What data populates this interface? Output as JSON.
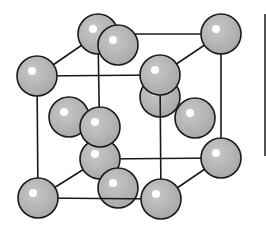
{
  "diagram": {
    "type": "crystal-lattice",
    "structure": "face-centered-cubic",
    "colors": {
      "background": "#ffffff",
      "atom_fill": "#b8b8b8",
      "atom_stroke": "#1a1a1a",
      "highlight": "#ffffff",
      "edge": "#1a1a1a"
    },
    "atom_radius": 20,
    "atoms": [
      {
        "id": "back-top-left-corner",
        "x": 98,
        "y": 34
      },
      {
        "id": "back-top-right-corner",
        "x": 221,
        "y": 34
      },
      {
        "id": "back-bottom-left-corner",
        "x": 100,
        "y": 159
      },
      {
        "id": "back-bottom-right-corner",
        "x": 221,
        "y": 158
      },
      {
        "id": "back-face-center",
        "x": 160,
        "y": 97
      },
      {
        "id": "left-face-center",
        "x": 69,
        "y": 117
      },
      {
        "id": "right-face-center",
        "x": 195,
        "y": 118
      },
      {
        "id": "top-face-center",
        "x": 118,
        "y": 45
      },
      {
        "id": "bottom-face-center",
        "x": 118,
        "y": 188
      },
      {
        "id": "front-face-center",
        "x": 100,
        "y": 127
      },
      {
        "id": "front-top-left-corner",
        "x": 37,
        "y": 76
      },
      {
        "id": "front-top-right-corner",
        "x": 160,
        "y": 75
      },
      {
        "id": "front-bottom-left-corner",
        "x": 38,
        "y": 198
      },
      {
        "id": "front-bottom-right-corner",
        "x": 161,
        "y": 199
      }
    ],
    "edges": [
      {
        "id": "back-top",
        "x1": 98,
        "y1": 34,
        "x2": 221,
        "y2": 34
      },
      {
        "id": "back-left",
        "x1": 98,
        "y1": 34,
        "x2": 100,
        "y2": 159
      },
      {
        "id": "back-right",
        "x1": 221,
        "y1": 34,
        "x2": 221,
        "y2": 158
      },
      {
        "id": "back-bottom",
        "x1": 100,
        "y1": 159,
        "x2": 221,
        "y2": 158
      },
      {
        "id": "top-left-depth",
        "x1": 37,
        "y1": 76,
        "x2": 98,
        "y2": 34
      },
      {
        "id": "top-right-depth",
        "x1": 160,
        "y1": 75,
        "x2": 221,
        "y2": 34
      },
      {
        "id": "bottom-left-depth",
        "x1": 38,
        "y1": 198,
        "x2": 100,
        "y2": 159
      },
      {
        "id": "bottom-right-depth",
        "x1": 161,
        "y1": 199,
        "x2": 221,
        "y2": 158
      },
      {
        "id": "front-top",
        "x1": 37,
        "y1": 76,
        "x2": 160,
        "y2": 75
      },
      {
        "id": "front-left",
        "x1": 37,
        "y1": 76,
        "x2": 38,
        "y2": 198
      },
      {
        "id": "front-right",
        "x1": 160,
        "y1": 75,
        "x2": 161,
        "y2": 199
      },
      {
        "id": "front-bottom",
        "x1": 38,
        "y1": 198,
        "x2": 161,
        "y2": 199
      }
    ],
    "side_bar": {
      "x": 265,
      "y1": 14,
      "y2": 156
    }
  }
}
